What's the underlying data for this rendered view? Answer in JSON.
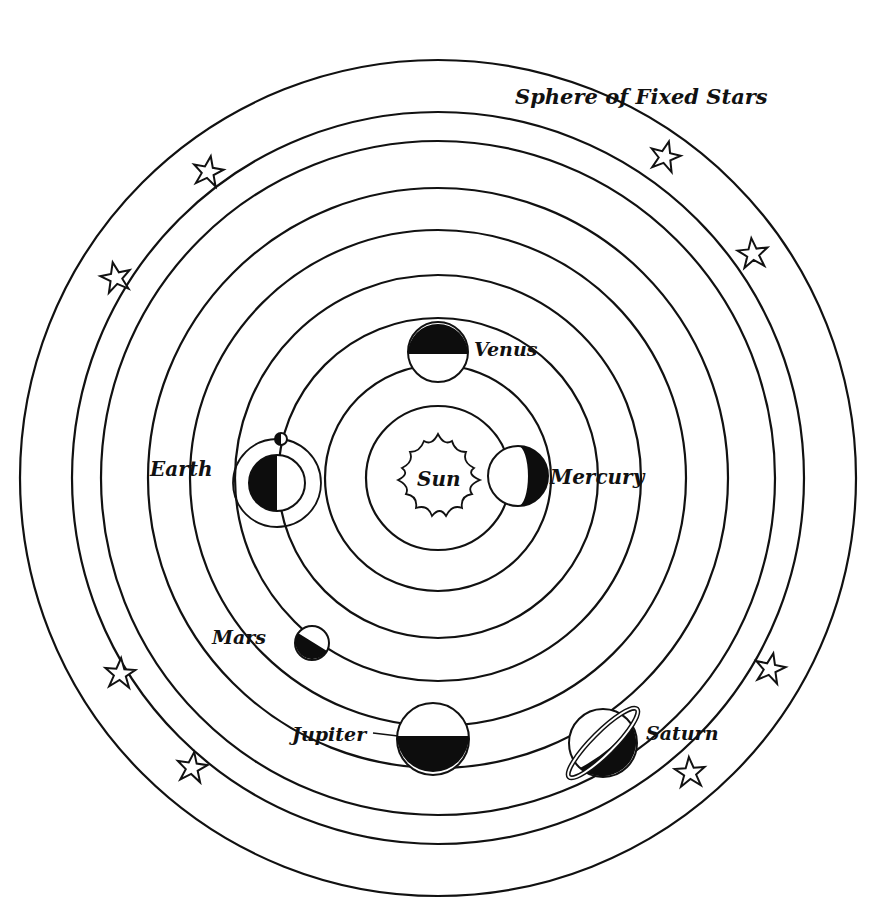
{
  "diagram": {
    "title": "Sphere of Fixed Stars",
    "type": "heliocentric-model",
    "center": {
      "x": 438,
      "y": 478
    },
    "colors": {
      "ink": "#111111",
      "paper": "#ffffff"
    },
    "orbits": [
      {
        "name": "sun-boundary",
        "r": 72
      },
      {
        "name": "mercury",
        "r": 113
      },
      {
        "name": "venus",
        "r": 160
      },
      {
        "name": "earth",
        "r": 203
      },
      {
        "name": "mars",
        "r": 248
      },
      {
        "name": "jupiter",
        "r": 290
      },
      {
        "name": "saturn",
        "r": 337
      },
      {
        "name": "fixed-stars-inner",
        "r": 366
      },
      {
        "name": "fixed-stars-outer",
        "r": 418
      }
    ],
    "bodies": {
      "sun": {
        "label": "Sun",
        "x": 438,
        "y": 478
      },
      "mercury": {
        "label": "Mercury",
        "x": 518,
        "y": 476,
        "r": 30,
        "phase": "right-dark"
      },
      "venus": {
        "label": "Venus",
        "x": 438,
        "y": 352,
        "r": 30,
        "phase": "top-dark"
      },
      "earth": {
        "label": "Earth",
        "x": 277,
        "y": 483,
        "r": 28,
        "phase": "left-dark",
        "moon_orbit_r": 44
      },
      "moon": {
        "x": 281,
        "y": 439,
        "r": 6
      },
      "mars": {
        "label": "Mars",
        "x": 312,
        "y": 643,
        "r": 17,
        "phase": "diagonal-dark"
      },
      "jupiter": {
        "label": "Jupiter",
        "x": 433,
        "y": 739,
        "r": 36,
        "phase": "bottom-dark"
      },
      "saturn": {
        "label": "Saturn",
        "x": 603,
        "y": 743,
        "r": 34,
        "phase": "ringed-dark"
      }
    },
    "labels": {
      "sphere": "Sphere of Fixed Stars",
      "sun": "Sun",
      "mercury": "Mercury",
      "venus": "Venus",
      "earth": "Earth",
      "mars": "Mars",
      "jupiter": "Jupiter",
      "saturn": "Saturn"
    },
    "stars": [
      {
        "x": 208,
        "y": 172
      },
      {
        "x": 116,
        "y": 278
      },
      {
        "x": 665,
        "y": 157
      },
      {
        "x": 753,
        "y": 254
      },
      {
        "x": 120,
        "y": 674
      },
      {
        "x": 192,
        "y": 768
      },
      {
        "x": 770,
        "y": 669
      },
      {
        "x": 690,
        "y": 773
      }
    ]
  }
}
